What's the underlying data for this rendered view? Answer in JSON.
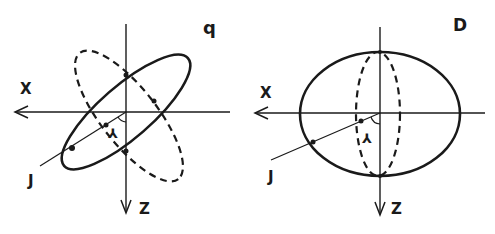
{
  "figure": {
    "panels": [
      {
        "id": "left",
        "panel_label": "q",
        "x_axis_label": "X",
        "z_axis_label": "Z",
        "ray_label": "J",
        "angle_label": "⅄",
        "description": "Tilted ellipse (solid) with a second tilted ellipse (dashed) crossing the X-Z axes; ray J at angle ⅄ from origin"
      },
      {
        "id": "right",
        "panel_label": "D",
        "x_axis_label": "X",
        "z_axis_label": "Z",
        "ray_label": "J",
        "angle_label": "⅄",
        "description": "Wide ellipse (solid) with narrow vertical ellipse (dashed) centred on Z axis; ray J at angle ⅄ from origin"
      }
    ],
    "colors": {
      "ink": "#1a1a1a",
      "background": "#ffffff"
    }
  }
}
